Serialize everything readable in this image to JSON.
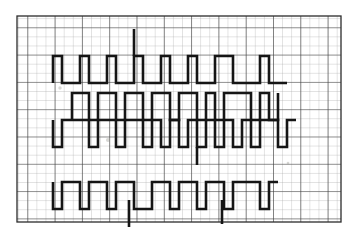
{
  "document": {
    "kind": "graph-paper-waveform-scan",
    "title": "Square-wave timing traces on graph paper",
    "background_color": "#fefefe",
    "paper_tint": "#f4f3f0"
  },
  "grid": {
    "origin_x": 17,
    "origin_y": 16,
    "width": 324,
    "height": 206,
    "minor_step": 9.1,
    "major_every": 3,
    "minor_color": "#9a9a99",
    "major_color": "#3c3c3c",
    "minor_width": 0.55,
    "major_width": 1.15,
    "border_color": "#2b2b2b",
    "border_width": 1.3
  },
  "trace_style": {
    "color": "#151515",
    "stroke_width": 2.6,
    "linecap": "butt",
    "linejoin": "miter"
  },
  "chart_data": {
    "type": "line",
    "xlabel": "",
    "ylabel": "",
    "grid": true,
    "legend": false,
    "xlim": [
      17,
      341
    ],
    "ylim": [
      16,
      222
    ],
    "series": [
      {
        "name": "trace-1-top-baseline",
        "description": "Long horizontal baseline with upward pulses, upper band",
        "points": [
          [
            53,
            83
          ],
          [
            53,
            56
          ],
          [
            62,
            56
          ],
          [
            62,
            83
          ],
          [
            80,
            83
          ],
          [
            80,
            56
          ],
          [
            89,
            56
          ],
          [
            89,
            83
          ],
          [
            107,
            83
          ],
          [
            107,
            56
          ],
          [
            116,
            56
          ],
          [
            116,
            83
          ],
          [
            134,
            83
          ],
          [
            134,
            56
          ],
          [
            143,
            56
          ],
          [
            143,
            83
          ],
          [
            161,
            83
          ],
          [
            161,
            56
          ],
          [
            170,
            56
          ],
          [
            170,
            83
          ],
          [
            188,
            83
          ],
          [
            188,
            56
          ],
          [
            197,
            56
          ],
          [
            197,
            83
          ],
          [
            215,
            83
          ],
          [
            215,
            56
          ],
          [
            233,
            56
          ],
          [
            233,
            83
          ],
          [
            260,
            83
          ],
          [
            260,
            56
          ],
          [
            269,
            56
          ],
          [
            269,
            83
          ],
          [
            287,
            83
          ]
        ]
      },
      {
        "name": "trace-1-baseline-extension-left",
        "description": "Baseline segment running left of first pulse",
        "points": [
          [
            53,
            83
          ],
          [
            53,
            83
          ]
        ]
      },
      {
        "name": "trace-1-spike",
        "description": "Tall isolated vertical spike above upper band",
        "points": [
          [
            134,
            56
          ],
          [
            134,
            29
          ]
        ]
      },
      {
        "name": "trace-2-upper",
        "description": "Second band square wave with downward pulses",
        "points": [
          [
            72,
            120
          ],
          [
            72,
            93
          ],
          [
            89,
            93
          ],
          [
            89,
            120
          ],
          [
            98,
            120
          ],
          [
            98,
            93
          ],
          [
            116,
            93
          ],
          [
            116,
            120
          ],
          [
            125,
            120
          ],
          [
            125,
            93
          ],
          [
            143,
            93
          ],
          [
            143,
            120
          ],
          [
            152,
            120
          ],
          [
            152,
            93
          ],
          [
            170,
            93
          ],
          [
            170,
            120
          ],
          [
            179,
            120
          ],
          [
            179,
            93
          ],
          [
            197,
            93
          ],
          [
            197,
            120
          ],
          [
            206,
            120
          ],
          [
            206,
            93
          ],
          [
            215,
            93
          ],
          [
            215,
            120
          ],
          [
            224,
            120
          ],
          [
            224,
            93
          ],
          [
            251,
            93
          ],
          [
            251,
            120
          ],
          [
            260,
            120
          ],
          [
            260,
            93
          ],
          [
            269,
            93
          ],
          [
            269,
            120
          ],
          [
            278,
            120
          ],
          [
            278,
            93
          ]
        ]
      },
      {
        "name": "trace-3-middle",
        "description": "Third band square wave, long baseline with many downward pulses",
        "points": [
          [
            53,
            120
          ],
          [
            53,
            147
          ],
          [
            62,
            147
          ],
          [
            62,
            120
          ],
          [
            89,
            120
          ],
          [
            89,
            147
          ],
          [
            98,
            147
          ],
          [
            98,
            120
          ],
          [
            116,
            120
          ],
          [
            116,
            147
          ],
          [
            125,
            147
          ],
          [
            125,
            120
          ],
          [
            143,
            120
          ],
          [
            143,
            147
          ],
          [
            152,
            147
          ],
          [
            152,
            120
          ],
          [
            161,
            120
          ],
          [
            161,
            147
          ],
          [
            170,
            147
          ],
          [
            170,
            120
          ],
          [
            179,
            120
          ],
          [
            179,
            147
          ],
          [
            188,
            147
          ],
          [
            188,
            120
          ],
          [
            197,
            120
          ],
          [
            197,
            147
          ],
          [
            206,
            147
          ],
          [
            206,
            120
          ],
          [
            215,
            120
          ],
          [
            215,
            147
          ],
          [
            224,
            147
          ],
          [
            224,
            120
          ],
          [
            233,
            120
          ],
          [
            233,
            147
          ],
          [
            242,
            147
          ],
          [
            242,
            120
          ],
          [
            251,
            120
          ],
          [
            251,
            147
          ],
          [
            260,
            147
          ],
          [
            260,
            120
          ],
          [
            278,
            120
          ],
          [
            278,
            147
          ],
          [
            287,
            147
          ],
          [
            287,
            120
          ],
          [
            296,
            120
          ]
        ]
      },
      {
        "name": "trace-4-bottom",
        "description": "Bottom band square wave with downward pulses",
        "points": [
          [
            53,
            182
          ],
          [
            53,
            209
          ],
          [
            62,
            209
          ],
          [
            62,
            182
          ],
          [
            80,
            182
          ],
          [
            80,
            209
          ],
          [
            89,
            209
          ],
          [
            89,
            182
          ],
          [
            107,
            182
          ],
          [
            107,
            209
          ],
          [
            116,
            209
          ],
          [
            116,
            182
          ],
          [
            134,
            182
          ],
          [
            134,
            209
          ],
          [
            152,
            209
          ],
          [
            152,
            182
          ],
          [
            170,
            182
          ],
          [
            170,
            209
          ],
          [
            179,
            209
          ],
          [
            179,
            182
          ],
          [
            197,
            182
          ],
          [
            197,
            209
          ],
          [
            206,
            209
          ],
          [
            206,
            182
          ],
          [
            224,
            182
          ],
          [
            224,
            209
          ],
          [
            233,
            209
          ],
          [
            233,
            182
          ],
          [
            260,
            182
          ],
          [
            260,
            209
          ],
          [
            269,
            209
          ],
          [
            269,
            182
          ],
          [
            278,
            182
          ]
        ]
      },
      {
        "name": "trace-4-spike-a",
        "description": "Isolated descending spike under bottom band, left",
        "points": [
          [
            129,
            200
          ],
          [
            129,
            227
          ]
        ]
      },
      {
        "name": "trace-4-spike-b",
        "description": "Isolated descending spike under bottom band, right",
        "points": [
          [
            222,
            200
          ],
          [
            222,
            224
          ]
        ]
      },
      {
        "name": "trace-2-spike",
        "description": "Short descending spike under second band",
        "points": [
          [
            197,
            147
          ],
          [
            197,
            165
          ]
        ]
      }
    ],
    "annotations": [
      {
        "name": "smudge-upper-left",
        "x": 60,
        "y": 88,
        "note": "pencil smudge"
      },
      {
        "name": "smudge-center",
        "x": 108,
        "y": 140,
        "note": "eraser mark"
      },
      {
        "name": "smudge-right",
        "x": 288,
        "y": 163,
        "note": "faint dot"
      }
    ]
  }
}
